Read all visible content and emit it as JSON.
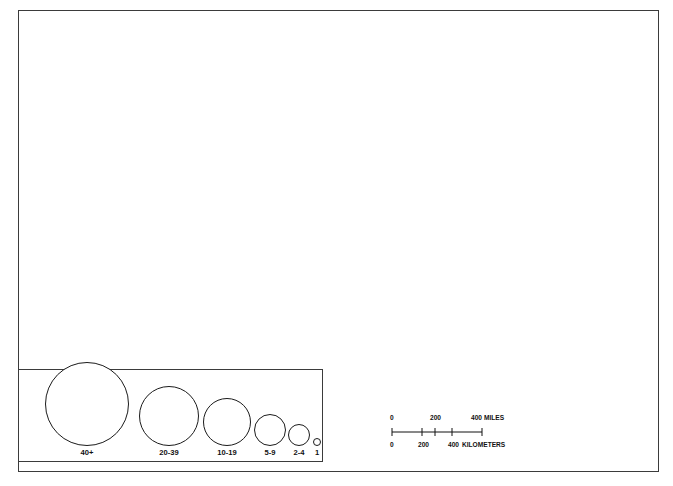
{
  "figure": {
    "type": "proportional-symbol-map",
    "region": "United States and adjacent Canada / Mexico"
  },
  "state_labels": [
    {
      "code": "BC",
      "x": 120,
      "y": 30
    },
    {
      "code": "AB",
      "x": 188,
      "y": 34
    },
    {
      "code": "SK",
      "x": 251,
      "y": 36
    },
    {
      "code": "MB",
      "x": 311,
      "y": 36
    },
    {
      "code": "ON",
      "x": 434,
      "y": 40
    },
    {
      "code": "PQ",
      "x": 558,
      "y": 46
    },
    {
      "code": "NB",
      "x": 639,
      "y": 36
    },
    {
      "code": "ME",
      "x": 621,
      "y": 69
    },
    {
      "code": "VT",
      "x": 589,
      "y": 89
    },
    {
      "code": "NH",
      "x": 604,
      "y": 96
    },
    {
      "code": "MA",
      "x": 619,
      "y": 118
    },
    {
      "code": "RI",
      "x": 628,
      "y": 134
    },
    {
      "code": "CT",
      "x": 612,
      "y": 143
    },
    {
      "code": "NY",
      "x": 562,
      "y": 126
    },
    {
      "code": "PA",
      "x": 553,
      "y": 148
    },
    {
      "code": "NJ",
      "x": 604,
      "y": 162
    },
    {
      "code": "DE",
      "x": 596,
      "y": 184
    },
    {
      "code": "MD",
      "x": 570,
      "y": 183
    },
    {
      "code": "WA",
      "x": 101,
      "y": 67
    },
    {
      "code": "OR",
      "x": 88,
      "y": 119
    },
    {
      "code": "ID",
      "x": 158,
      "y": 133
    },
    {
      "code": "MT",
      "x": 210,
      "y": 87
    },
    {
      "code": "ND",
      "x": 307,
      "y": 92
    },
    {
      "code": "SD",
      "x": 307,
      "y": 133
    },
    {
      "code": "NE",
      "x": 311,
      "y": 178
    },
    {
      "code": "WY",
      "x": 229,
      "y": 152
    },
    {
      "code": "NV",
      "x": 118,
      "y": 182
    },
    {
      "code": "UT",
      "x": 180,
      "y": 202
    },
    {
      "code": "CO",
      "x": 249,
      "y": 215
    },
    {
      "code": "KS",
      "x": 327,
      "y": 223
    },
    {
      "code": "CA",
      "x": 78,
      "y": 219
    },
    {
      "code": "AZ",
      "x": 169,
      "y": 275
    },
    {
      "code": "NM",
      "x": 231,
      "y": 285
    },
    {
      "code": "OK",
      "x": 346,
      "y": 267
    },
    {
      "code": "TX",
      "x": 315,
      "y": 322
    },
    {
      "code": "MO",
      "x": 385,
      "y": 205
    },
    {
      "code": "IA",
      "x": 380,
      "y": 165
    },
    {
      "code": "MN",
      "x": 364,
      "y": 93
    },
    {
      "code": "WI",
      "x": 414,
      "y": 123
    },
    {
      "code": "IL",
      "x": 428,
      "y": 175
    },
    {
      "code": "MI",
      "x": 470,
      "y": 125
    },
    {
      "code": "IN",
      "x": 463,
      "y": 179
    },
    {
      "code": "OH",
      "x": 500,
      "y": 176
    },
    {
      "code": "KY",
      "x": 486,
      "y": 201
    },
    {
      "code": "WV",
      "x": 524,
      "y": 197
    },
    {
      "code": "VA",
      "x": 551,
      "y": 211
    },
    {
      "code": "NC",
      "x": 558,
      "y": 243
    },
    {
      "code": "SC",
      "x": 545,
      "y": 271
    },
    {
      "code": "TN",
      "x": 469,
      "y": 257
    },
    {
      "code": "AR",
      "x": 402,
      "y": 270
    },
    {
      "code": "MS",
      "x": 437,
      "y": 296
    },
    {
      "code": "AL",
      "x": 470,
      "y": 296
    },
    {
      "code": "GA",
      "x": 512,
      "y": 292
    },
    {
      "code": "LA",
      "x": 399,
      "y": 323
    },
    {
      "code": "FL",
      "x": 541,
      "y": 347
    }
  ],
  "graticule_labels": {
    "left": [
      {
        "text": "45°",
        "x": 29,
        "y": 76
      },
      {
        "text": "40°",
        "x": 27,
        "y": 154
      },
      {
        "text": "35°",
        "x": 27,
        "y": 240
      },
      {
        "text": "30°",
        "x": 27,
        "y": 320
      }
    ],
    "right": [
      {
        "text": "40°",
        "x": 650,
        "y": 140
      },
      {
        "text": "35°",
        "x": 648,
        "y": 215
      },
      {
        "text": "30°",
        "x": 646,
        "y": 293
      },
      {
        "text": "25°",
        "x": 645,
        "y": 372
      }
    ],
    "bottom": [
      {
        "text": "95°",
        "x": 378,
        "y": 466
      },
      {
        "text": "90°",
        "x": 453,
        "y": 466
      },
      {
        "text": "85°",
        "x": 530,
        "y": 466
      },
      {
        "text": "80°",
        "x": 604,
        "y": 466
      }
    ]
  },
  "legend": {
    "items": [
      {
        "label": "40+",
        "radius": 42,
        "cx": 68
      },
      {
        "label": "20-39",
        "radius": 30,
        "cx": 150
      },
      {
        "label": "10-19",
        "radius": 24,
        "cx": 208
      },
      {
        "label": "5-9",
        "radius": 16,
        "cx": 251
      },
      {
        "label": "2-4",
        "radius": 11,
        "cx": 280
      },
      {
        "label": "1",
        "radius": 4,
        "cx": 298
      }
    ]
  },
  "scale_bar": {
    "miles": {
      "ticks": [
        "0",
        "200",
        "400"
      ],
      "unit": "MILES"
    },
    "kilometers": {
      "ticks": [
        "0",
        "200",
        "400"
      ],
      "unit": "KILOMETERS"
    }
  },
  "colors": {
    "land_us": "#d2d2d2",
    "land_foreign": "#a8a8a8",
    "ocean": "#ffffff",
    "border": "#3b3b3b",
    "symbol": "#1b1b1b",
    "graticule": "#b0b0b0"
  },
  "chart_data": {
    "type": "scatter",
    "title": "",
    "symbol_encoding": "circle area proportional to count",
    "classes": [
      "1",
      "2-4",
      "5-9",
      "10-19",
      "20-39",
      "40+"
    ],
    "points": [
      {
        "x": 103,
        "y": 55,
        "r": 27,
        "place": "WA-Puget Sound"
      },
      {
        "x": 80,
        "y": 84,
        "r": 5,
        "place": "WA-southwest"
      },
      {
        "x": 140,
        "y": 131,
        "r": 12,
        "place": "ID"
      },
      {
        "x": 70,
        "y": 202,
        "r": 12,
        "place": "CA-north-bay-a"
      },
      {
        "x": 63,
        "y": 199,
        "r": 20,
        "place": "CA-bay-b"
      },
      {
        "x": 59,
        "y": 198,
        "r": 27,
        "place": "CA-bay-c"
      },
      {
        "x": 62,
        "y": 199,
        "r": 8,
        "place": "CA-bay-d"
      },
      {
        "x": 70,
        "y": 200,
        "r": 16,
        "place": "CA-bay-e"
      },
      {
        "x": 75,
        "y": 204,
        "r": 4,
        "place": "CA-bay-f"
      },
      {
        "x": 77,
        "y": 253,
        "r": 6,
        "place": "CA-central"
      },
      {
        "x": 92,
        "y": 277,
        "r": 25,
        "place": "CA-LA-outer"
      },
      {
        "x": 99,
        "y": 285,
        "r": 13,
        "place": "CA-LA-inner"
      },
      {
        "x": 93,
        "y": 268,
        "r": 6,
        "place": "CA-LA-small"
      },
      {
        "x": 106,
        "y": 293,
        "r": 10,
        "place": "CA-south"
      },
      {
        "x": 126,
        "y": 248,
        "r": 13,
        "place": "NV-Vegas"
      },
      {
        "x": 162,
        "y": 175,
        "r": 5,
        "place": "UT-SLC"
      },
      {
        "x": 169,
        "y": 275,
        "r": 25,
        "place": "AZ-Phoenix"
      },
      {
        "x": 248,
        "y": 208,
        "r": 18,
        "place": "CO-Denver-outer"
      },
      {
        "x": 248,
        "y": 206,
        "r": 12,
        "place": "CO-Denver-mid"
      },
      {
        "x": 249,
        "y": 204,
        "r": 6,
        "place": "CO-Denver-inner"
      },
      {
        "x": 229,
        "y": 319,
        "r": 4,
        "place": "NM"
      },
      {
        "x": 378,
        "y": 116,
        "r": 22,
        "place": "MN-Mpls-outer"
      },
      {
        "x": 380,
        "y": 113,
        "r": 12,
        "place": "MN-Mpls-mid"
      },
      {
        "x": 381,
        "y": 112,
        "r": 6,
        "place": "MN-Mpls-inner"
      },
      {
        "x": 382,
        "y": 127,
        "r": 5,
        "place": "MN-south"
      },
      {
        "x": 351,
        "y": 178,
        "r": 13,
        "place": "NE-Omaha"
      },
      {
        "x": 381,
        "y": 185,
        "r": 5,
        "place": "IA-south"
      },
      {
        "x": 344,
        "y": 265,
        "r": 16,
        "place": "OK-OKC"
      },
      {
        "x": 357,
        "y": 248,
        "r": 9,
        "place": "OK-north"
      },
      {
        "x": 363,
        "y": 244,
        "r": 5,
        "place": "OK-ne"
      },
      {
        "x": 371,
        "y": 238,
        "r": 6,
        "place": "KS-se"
      },
      {
        "x": 402,
        "y": 268,
        "r": 13,
        "place": "AR-LittleRock"
      },
      {
        "x": 398,
        "y": 206,
        "r": 18,
        "place": "MO-StLouis"
      },
      {
        "x": 392,
        "y": 213,
        "r": 5,
        "place": "MO-small"
      },
      {
        "x": 335,
        "y": 302,
        "r": 29,
        "place": "TX-DFW-outer"
      },
      {
        "x": 341,
        "y": 305,
        "r": 16,
        "place": "TX-DFW-inner"
      },
      {
        "x": 357,
        "y": 308,
        "r": 6,
        "place": "TX-east"
      },
      {
        "x": 371,
        "y": 335,
        "r": 28,
        "place": "TX-Houston"
      },
      {
        "x": 330,
        "y": 348,
        "r": 20,
        "place": "TX-Austin-SA"
      },
      {
        "x": 333,
        "y": 347,
        "r": 7,
        "place": "TX-SA-inner"
      },
      {
        "x": 363,
        "y": 348,
        "r": 6,
        "place": "TX-south"
      },
      {
        "x": 423,
        "y": 146,
        "r": 21,
        "place": "IL-Chicago-a"
      },
      {
        "x": 432,
        "y": 148,
        "r": 28,
        "place": "IL-Chicago-b"
      },
      {
        "x": 437,
        "y": 151,
        "r": 17,
        "place": "IL-Chicago-c"
      },
      {
        "x": 428,
        "y": 156,
        "r": 10,
        "place": "IL-Chicago-d"
      },
      {
        "x": 443,
        "y": 160,
        "r": 6,
        "place": "IN-nw"
      },
      {
        "x": 413,
        "y": 176,
        "r": 5,
        "place": "IL-central"
      },
      {
        "x": 417,
        "y": 194,
        "r": 18,
        "place": "IL-south"
      },
      {
        "x": 466,
        "y": 192,
        "r": 14,
        "place": "IN-Indy"
      },
      {
        "x": 470,
        "y": 187,
        "r": 8,
        "place": "IN-Indy-inner"
      },
      {
        "x": 477,
        "y": 134,
        "r": 22,
        "place": "MI-Detroit-outer"
      },
      {
        "x": 482,
        "y": 137,
        "r": 14,
        "place": "MI-Detroit-inner"
      },
      {
        "x": 494,
        "y": 147,
        "r": 18,
        "place": "MI-se"
      },
      {
        "x": 498,
        "y": 155,
        "r": 10,
        "place": "OH-Toledo"
      },
      {
        "x": 505,
        "y": 163,
        "r": 16,
        "place": "OH-Cleveland"
      },
      {
        "x": 497,
        "y": 187,
        "r": 21,
        "place": "OH-Columbus"
      },
      {
        "x": 490,
        "y": 198,
        "r": 9,
        "place": "OH-south"
      },
      {
        "x": 481,
        "y": 207,
        "r": 12,
        "place": "KY-Louisville"
      },
      {
        "x": 489,
        "y": 213,
        "r": 7,
        "place": "KY-central"
      },
      {
        "x": 462,
        "y": 213,
        "r": 5,
        "place": "KY-west"
      },
      {
        "x": 470,
        "y": 252,
        "r": 12,
        "place": "TN-Nashville"
      },
      {
        "x": 473,
        "y": 250,
        "r": 6,
        "place": "TN-inner"
      },
      {
        "x": 525,
        "y": 233,
        "r": 6,
        "place": "NC-west"
      },
      {
        "x": 541,
        "y": 238,
        "r": 21,
        "place": "NC-Charlotte"
      },
      {
        "x": 545,
        "y": 234,
        "r": 9,
        "place": "NC-Raleigh"
      },
      {
        "x": 558,
        "y": 238,
        "r": 6,
        "place": "NC-east"
      },
      {
        "x": 538,
        "y": 267,
        "r": 5,
        "place": "SC"
      },
      {
        "x": 499,
        "y": 277,
        "r": 19,
        "place": "GA-Atlanta"
      },
      {
        "x": 501,
        "y": 276,
        "r": 7,
        "place": "GA-Atlanta-inner"
      },
      {
        "x": 487,
        "y": 263,
        "r": 5,
        "place": "GA-nw"
      },
      {
        "x": 490,
        "y": 300,
        "r": 4,
        "place": "GA-south"
      },
      {
        "x": 468,
        "y": 290,
        "r": 5,
        "place": "AL-Birmingham"
      },
      {
        "x": 429,
        "y": 335,
        "r": 5,
        "place": "MS-south"
      },
      {
        "x": 446,
        "y": 341,
        "r": 5,
        "place": "LA-NewOrleans"
      },
      {
        "x": 535,
        "y": 318,
        "r": 14,
        "place": "FL-Jacksonville"
      },
      {
        "x": 548,
        "y": 351,
        "r": 5,
        "place": "FL-Orlando"
      },
      {
        "x": 530,
        "y": 363,
        "r": 15,
        "place": "FL-Tampa"
      },
      {
        "x": 543,
        "y": 362,
        "r": 5,
        "place": "FL-central"
      },
      {
        "x": 570,
        "y": 372,
        "r": 16,
        "place": "FL-Miami-a"
      },
      {
        "x": 573,
        "y": 387,
        "r": 16,
        "place": "FL-Miami-b"
      },
      {
        "x": 572,
        "y": 382,
        "r": 5,
        "place": "FL-Miami-inner"
      },
      {
        "x": 553,
        "y": 208,
        "r": 14,
        "place": "VA-Richmond"
      },
      {
        "x": 558,
        "y": 196,
        "r": 6,
        "place": "VA-north"
      },
      {
        "x": 541,
        "y": 127,
        "r": 13,
        "place": "NY-west"
      },
      {
        "x": 549,
        "y": 136,
        "r": 6,
        "place": "NY-Syracuse"
      },
      {
        "x": 572,
        "y": 127,
        "r": 11,
        "place": "NY-Albany"
      },
      {
        "x": 589,
        "y": 110,
        "r": 16,
        "place": "MA-Springfield"
      },
      {
        "x": 601,
        "y": 116,
        "r": 12,
        "place": "MA-Boston-outer"
      },
      {
        "x": 605,
        "y": 114,
        "r": 7,
        "place": "MA-Boston-inner"
      },
      {
        "x": 613,
        "y": 101,
        "r": 5,
        "place": "NH-coast"
      },
      {
        "x": 620,
        "y": 128,
        "r": 6,
        "place": "RI"
      },
      {
        "x": 598,
        "y": 140,
        "r": 12,
        "place": "CT-Hartford"
      },
      {
        "x": 598,
        "y": 148,
        "r": 22,
        "place": "NY-metro-outer"
      },
      {
        "x": 586,
        "y": 150,
        "r": 30,
        "place": "NY-metro-a"
      },
      {
        "x": 582,
        "y": 152,
        "r": 22,
        "place": "NY-metro-b"
      },
      {
        "x": 580,
        "y": 155,
        "r": 15,
        "place": "NY-metro-c"
      },
      {
        "x": 578,
        "y": 153,
        "r": 9,
        "place": "NY-metro-d"
      },
      {
        "x": 584,
        "y": 158,
        "r": 5,
        "place": "NY-metro-e"
      },
      {
        "x": 576,
        "y": 163,
        "r": 12,
        "place": "NJ-central"
      },
      {
        "x": 571,
        "y": 170,
        "r": 6,
        "place": "NJ-south"
      },
      {
        "x": 566,
        "y": 178,
        "r": 18,
        "place": "PA-Philadelphia"
      },
      {
        "x": 567,
        "y": 180,
        "r": 9,
        "place": "PA-Phila-inner"
      },
      {
        "x": 552,
        "y": 167,
        "r": 6,
        "place": "PA-Harrisburg"
      },
      {
        "x": 562,
        "y": 194,
        "r": 12,
        "place": "MD-Baltimore"
      },
      {
        "x": 569,
        "y": 191,
        "r": 5,
        "place": "MD-east"
      },
      {
        "x": 553,
        "y": 190,
        "r": 6,
        "place": "MD-DC"
      },
      {
        "x": 527,
        "y": 147,
        "r": 12,
        "place": "PA-Pittsburgh"
      },
      {
        "x": 534,
        "y": 151,
        "r": 5,
        "place": "PA-west"
      },
      {
        "x": 521,
        "y": 172,
        "r": 17,
        "place": "WV-north"
      }
    ],
    "xlabel": "longitude",
    "ylabel": "latitude"
  }
}
